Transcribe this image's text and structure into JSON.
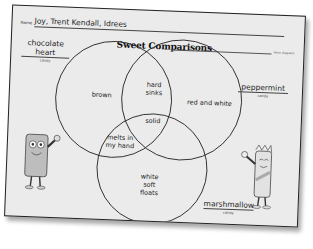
{
  "worksheet": {
    "name_label": "Name",
    "name_value": "Joy, Trent Kendall, Idrees",
    "title": "Sweet Comparisons",
    "corner_label": "Venn diagram",
    "candies": {
      "left": {
        "name_line1": "chocolate",
        "name_line2": "heart",
        "sub": "candy"
      },
      "right": {
        "name": "peppermint",
        "sub": "candy"
      },
      "bottom": {
        "name": "marshmallow",
        "sub": "candy"
      }
    },
    "regions": {
      "chocolate_only": "brown",
      "chocolate_peppermint_line1": "hard",
      "chocolate_peppermint_line2": "sinks",
      "peppermint_only": "red and white",
      "all_three": "solid",
      "chocolate_marshmallow_line1": "melts in",
      "chocolate_marshmallow_line2": "my hand",
      "marshmallow_only_line1": "white",
      "marshmallow_only_line2": "soft",
      "marshmallow_only_line3": "floats"
    },
    "colors": {
      "paper": "#ebebeb",
      "ink": "#222222",
      "shadow": "#555555"
    }
  }
}
